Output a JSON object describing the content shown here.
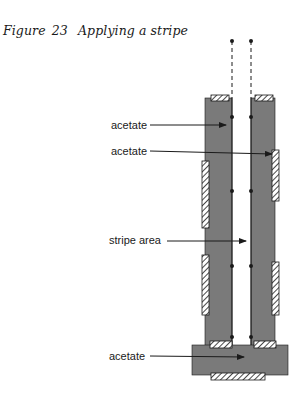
{
  "figure": {
    "caption_prefix": "Figure",
    "caption_number": "23",
    "caption_title": "Applying a stripe"
  },
  "labels": [
    {
      "id": "acetate-top",
      "text": "acetate"
    },
    {
      "id": "acetate-upper-right",
      "text": "acetate"
    },
    {
      "id": "stripe-area",
      "text": "stripe area"
    },
    {
      "id": "acetate-bottom",
      "text": "acetate"
    }
  ],
  "colors": {
    "strip_fill": "#7a7a7a",
    "line": "#1a1a1a",
    "background": "#ffffff"
  }
}
